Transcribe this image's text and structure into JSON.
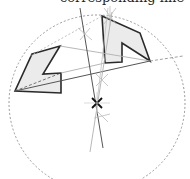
{
  "caption": "corresponding line",
  "colors": {
    "polygon_stroke": "#2a2a2a",
    "polygon_fill": "#ebebeb",
    "circle": "#9a9a9a",
    "thin_line": "#b0b0b0",
    "axis_line": "#555555",
    "center_mark": "#111111"
  }
}
